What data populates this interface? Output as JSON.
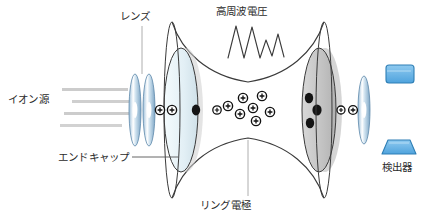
{
  "diagram": {
    "labels": {
      "lens": "レンズ",
      "rf_voltage": "高周波電圧",
      "ion_source": "イオン源",
      "end_cap": "エンドキャップ",
      "ring_electrode": "リング電極",
      "detector": "検出器"
    },
    "icons": {
      "lens_left": "lens-element",
      "lens_right": "lens-element",
      "endcap_left": "endcap-electrode",
      "endcap_right": "endcap-electrode",
      "ring_electrode": "ring-electrode-hyperbola",
      "rf_waveform": "sine-wave",
      "ion_beam": "ion-beam-lines",
      "detector_top": "detector-plate",
      "detector_bottom": "detector-cone"
    },
    "colors": {
      "stroke": "#3a3a3a",
      "lens_fill": "#bcd4e8",
      "lens_fill_dark": "#7ea8c9",
      "endcap_left_fill": "#e4f0f5",
      "endcap_right_fill": "#c9c9c9",
      "detector_fill": "#6fb7e8",
      "detector_stroke": "#2f7fb5",
      "ion_plus": "#1a1a1a",
      "neutral_dot": "#111111",
      "beam_line": "#c8c8c8",
      "leader_line": "#9a9a9a",
      "background": "#ffffff"
    },
    "particles": {
      "trapped_ion_symbol": "+",
      "trapped_ion_count": 8,
      "entry_ion_count": 2,
      "exit_ion_count": 2,
      "neutral_dot_count_left": 1,
      "neutral_dot_count_right": 3
    },
    "beam_lines": 4
  }
}
